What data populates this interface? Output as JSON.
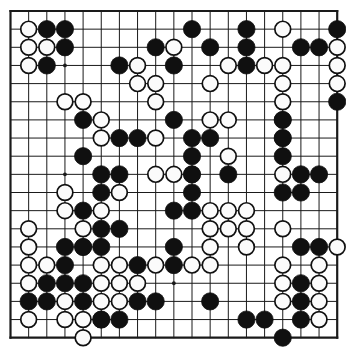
{
  "board": {
    "name": "go-board",
    "size": 19,
    "colors": {
      "background": "#ffffff",
      "grid_line": "#1a1a1a",
      "border_line": "#1a1a1a",
      "black_stone": "#101010",
      "white_stone_fill": "#fbfbfb",
      "white_stone_edge": "#101010",
      "star_point": "#1a1a1a"
    },
    "geometry": {
      "origin_x": 10.5,
      "origin_y": 11.0,
      "spacing": 18.15,
      "stone_radius": 8.6,
      "grid_line_width": 1.0,
      "border_line_width": 2.2,
      "star_radius": 1.9
    },
    "star_points": [
      [
        3,
        3
      ],
      [
        9,
        3
      ],
      [
        15,
        3
      ],
      [
        3,
        9
      ],
      [
        9,
        9
      ],
      [
        15,
        9
      ],
      [
        3,
        15
      ],
      [
        9,
        15
      ],
      [
        15,
        15
      ]
    ],
    "black_stones": [
      [
        2,
        1
      ],
      [
        3,
        1
      ],
      [
        10,
        1
      ],
      [
        13,
        1
      ],
      [
        18,
        1
      ],
      [
        3,
        2
      ],
      [
        8,
        2
      ],
      [
        11,
        2
      ],
      [
        13,
        2
      ],
      [
        16,
        2
      ],
      [
        17,
        2
      ],
      [
        2,
        3
      ],
      [
        6,
        3
      ],
      [
        9,
        3
      ],
      [
        13,
        3
      ],
      [
        18,
        5
      ],
      [
        4,
        6
      ],
      [
        9,
        6
      ],
      [
        15,
        6
      ],
      [
        6,
        7
      ],
      [
        7,
        7
      ],
      [
        10,
        7
      ],
      [
        11,
        7
      ],
      [
        15,
        7
      ],
      [
        4,
        8
      ],
      [
        10,
        8
      ],
      [
        15,
        8
      ],
      [
        5,
        9
      ],
      [
        6,
        9
      ],
      [
        10,
        9
      ],
      [
        12,
        9
      ],
      [
        16,
        9
      ],
      [
        17,
        9
      ],
      [
        5,
        10
      ],
      [
        10,
        10
      ],
      [
        15,
        10
      ],
      [
        16,
        10
      ],
      [
        4,
        11
      ],
      [
        9,
        11
      ],
      [
        10,
        11
      ],
      [
        5,
        12
      ],
      [
        6,
        12
      ],
      [
        3,
        13
      ],
      [
        4,
        13
      ],
      [
        5,
        13
      ],
      [
        9,
        13
      ],
      [
        16,
        13
      ],
      [
        17,
        13
      ],
      [
        3,
        14
      ],
      [
        7,
        14
      ],
      [
        9,
        14
      ],
      [
        2,
        15
      ],
      [
        3,
        15
      ],
      [
        4,
        15
      ],
      [
        16,
        15
      ],
      [
        1,
        16
      ],
      [
        2,
        16
      ],
      [
        4,
        16
      ],
      [
        7,
        16
      ],
      [
        8,
        16
      ],
      [
        11,
        16
      ],
      [
        16,
        16
      ],
      [
        5,
        17
      ],
      [
        6,
        17
      ],
      [
        13,
        17
      ],
      [
        14,
        17
      ],
      [
        16,
        17
      ],
      [
        15,
        18
      ]
    ],
    "white_stones": [
      [
        1,
        1
      ],
      [
        15,
        1
      ],
      [
        1,
        2
      ],
      [
        2,
        2
      ],
      [
        9,
        2
      ],
      [
        18,
        2
      ],
      [
        1,
        3
      ],
      [
        14,
        3
      ],
      [
        15,
        3
      ],
      [
        18,
        3
      ],
      [
        7,
        3
      ],
      [
        12,
        3
      ],
      [
        7,
        4
      ],
      [
        8,
        4
      ],
      [
        11,
        4
      ],
      [
        15,
        4
      ],
      [
        3,
        5
      ],
      [
        4,
        5
      ],
      [
        8,
        5
      ],
      [
        15,
        5
      ],
      [
        18,
        4
      ],
      [
        5,
        6
      ],
      [
        11,
        6
      ],
      [
        12,
        6
      ],
      [
        15,
        6
      ],
      [
        5,
        7
      ],
      [
        8,
        7
      ],
      [
        15,
        7
      ],
      [
        12,
        8
      ],
      [
        8,
        9
      ],
      [
        9,
        9
      ],
      [
        10,
        9
      ],
      [
        15,
        9
      ],
      [
        3,
        10
      ],
      [
        6,
        10
      ],
      [
        3,
        11
      ],
      [
        5,
        11
      ],
      [
        11,
        11
      ],
      [
        12,
        11
      ],
      [
        13,
        11
      ],
      [
        1,
        12
      ],
      [
        4,
        12
      ],
      [
        11,
        12
      ],
      [
        12,
        12
      ],
      [
        13,
        12
      ],
      [
        15,
        12
      ],
      [
        1,
        13
      ],
      [
        4,
        13
      ],
      [
        11,
        13
      ],
      [
        13,
        13
      ],
      [
        18,
        13
      ],
      [
        1,
        14
      ],
      [
        2,
        14
      ],
      [
        5,
        14
      ],
      [
        6,
        14
      ],
      [
        8,
        14
      ],
      [
        10,
        14
      ],
      [
        11,
        14
      ],
      [
        15,
        14
      ],
      [
        17,
        14
      ],
      [
        1,
        15
      ],
      [
        5,
        15
      ],
      [
        6,
        15
      ],
      [
        7,
        15
      ],
      [
        15,
        15
      ],
      [
        17,
        15
      ],
      [
        3,
        16
      ],
      [
        5,
        16
      ],
      [
        6,
        16
      ],
      [
        15,
        16
      ],
      [
        17,
        16
      ],
      [
        1,
        17
      ],
      [
        3,
        17
      ],
      [
        4,
        17
      ],
      [
        5,
        17
      ],
      [
        17,
        17
      ],
      [
        4,
        18
      ]
    ]
  }
}
